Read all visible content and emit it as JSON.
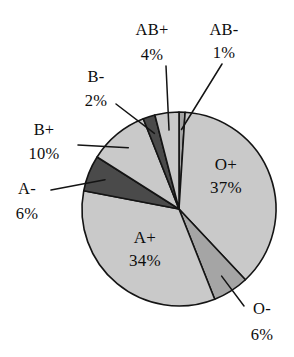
{
  "chart_data": {
    "type": "pie",
    "title": "",
    "subtitle": "",
    "xlabel": "",
    "ylabel": "",
    "legend_position": "none",
    "grid": false,
    "units": "percent",
    "total": 100,
    "start_angle_deg": 0,
    "direction": "clockwise",
    "categories": [
      "AB-",
      "O+",
      "O-",
      "A+",
      "A-",
      "B+",
      "B-",
      "AB+"
    ],
    "values": [
      1,
      37,
      6,
      34,
      6,
      10,
      2,
      4
    ],
    "slices": [
      {
        "label": "AB-",
        "value": 1,
        "value_text": "1%",
        "color": "#a5a5a5",
        "label_placement": "outside",
        "label_x": 224,
        "label_y": 35,
        "pct_x": 224,
        "pct_y": 58,
        "leader": true
      },
      {
        "label": "O+",
        "value": 37,
        "value_text": "37%",
        "color": "#c9c9c9",
        "label_placement": "inside",
        "label_x": 226,
        "label_y": 170,
        "pct_x": 226,
        "pct_y": 193,
        "leader": false
      },
      {
        "label": "O-",
        "value": 6,
        "value_text": "6%",
        "color": "#a5a5a5",
        "label_placement": "outside",
        "label_x": 262,
        "label_y": 314,
        "pct_x": 262,
        "pct_y": 340,
        "leader": true
      },
      {
        "label": "A+",
        "value": 34,
        "value_text": "34%",
        "color": "#c9c9c9",
        "label_placement": "inside",
        "label_x": 145,
        "label_y": 243,
        "pct_x": 145,
        "pct_y": 266,
        "leader": false
      },
      {
        "label": "A-",
        "value": 6,
        "value_text": "6%",
        "color": "#4a4a4a",
        "label_placement": "outside",
        "label_x": 27,
        "label_y": 194,
        "pct_x": 27,
        "pct_y": 219,
        "leader": true
      },
      {
        "label": "B+",
        "value": 10,
        "value_text": "10%",
        "color": "#c9c9c9",
        "label_placement": "outside",
        "label_x": 44,
        "label_y": 135,
        "pct_x": 44,
        "pct_y": 159,
        "leader": true
      },
      {
        "label": "B-",
        "value": 2,
        "value_text": "2%",
        "color": "#4a4a4a",
        "label_placement": "outside",
        "label_x": 96,
        "label_y": 82,
        "pct_x": 96,
        "pct_y": 106,
        "leader": true
      },
      {
        "label": "AB+",
        "value": 4,
        "value_text": "4%",
        "color": "#c9c9c9",
        "label_placement": "outside",
        "label_x": 152,
        "label_y": 35,
        "pct_x": 152,
        "pct_y": 60,
        "leader": true
      }
    ],
    "geometry": {
      "center_x": 179,
      "center_y": 209,
      "radius": 97
    },
    "palette": {
      "light_gray": "#c9c9c9",
      "medium_gray": "#a5a5a5",
      "dark_gray": "#4a4a4a",
      "outline": "#141414",
      "background": "#ffffff"
    }
  }
}
